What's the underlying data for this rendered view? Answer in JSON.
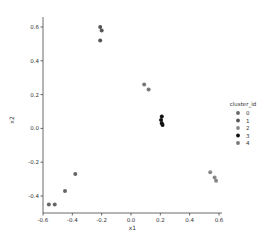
{
  "chart_data": {
    "type": "scatter",
    "title": "",
    "xlabel": "x1",
    "ylabel": "x2",
    "xlim": [
      -0.62,
      0.62
    ],
    "ylim": [
      -0.5,
      0.66
    ],
    "xticks": [
      -0.6,
      -0.4,
      -0.2,
      0.0,
      0.2,
      0.4,
      0.6
    ],
    "xtick_labels": [
      "-0.6",
      "-0.4",
      "-0.2",
      "0.0",
      "0.2",
      "0.4",
      "0.6"
    ],
    "yticks": [
      -0.4,
      -0.2,
      0.0,
      0.2,
      0.4,
      0.6
    ],
    "ytick_labels": [
      "-0.4",
      "-0.2",
      "0.0",
      "0.2",
      "0.4",
      "0.6"
    ],
    "grid": false,
    "legend": {
      "title": "cluster_id",
      "position": "right",
      "entries": [
        "0",
        "1",
        "2",
        "3",
        "4"
      ]
    },
    "series": [
      {
        "name": "0",
        "color": "#666666",
        "points": [
          [
            -0.56,
            -0.45
          ],
          [
            -0.52,
            -0.45
          ],
          [
            -0.45,
            -0.37
          ],
          [
            -0.38,
            -0.27
          ]
        ]
      },
      {
        "name": "1",
        "color": "#555555",
        "points": [
          [
            -0.21,
            0.6
          ],
          [
            -0.2,
            0.58
          ],
          [
            -0.21,
            0.52
          ]
        ]
      },
      {
        "name": "2",
        "color": "#888888",
        "points": [
          [
            0.54,
            -0.26
          ],
          [
            0.57,
            -0.29
          ],
          [
            0.58,
            -0.31
          ]
        ]
      },
      {
        "name": "3",
        "color": "#111111",
        "points": [
          [
            0.21,
            0.07
          ],
          [
            0.205,
            0.05
          ],
          [
            0.21,
            0.03
          ],
          [
            0.215,
            0.02
          ]
        ]
      },
      {
        "name": "4",
        "color": "#777777",
        "points": [
          [
            0.09,
            0.26
          ],
          [
            0.12,
            0.23
          ]
        ]
      }
    ]
  }
}
